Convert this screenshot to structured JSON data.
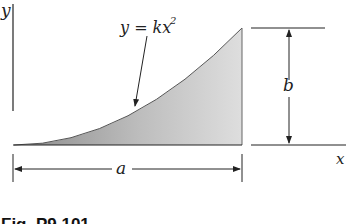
{
  "figure": {
    "caption": "Fig. P9.101",
    "axis_labels": {
      "y": "y",
      "x": "x"
    },
    "curve_equation": "y = kx",
    "curve_exponent": "2",
    "dimensions": {
      "width": "a",
      "height": "b"
    },
    "colors": {
      "shade_dark": "#8c8c8c",
      "shade_light": "#dcdcdc",
      "line": "#222222",
      "background": "#ffffff"
    }
  }
}
